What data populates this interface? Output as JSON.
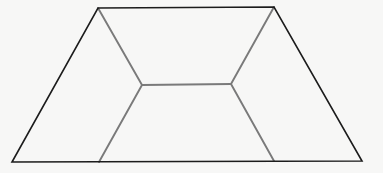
{
  "figure": {
    "type": "trapezoid-dissection",
    "background": "#f7f7f6",
    "outer_stroke": "#1c1c1c",
    "inner_stroke": "#7a7a7a",
    "outer_width": 1.6,
    "inner_width": 1.9,
    "outer_trapezoid": [
      [
        98,
        8
      ],
      [
        274,
        7
      ],
      [
        362,
        161
      ],
      [
        12,
        162
      ]
    ],
    "inner_segments": [
      {
        "name": "upper-left-diagonal",
        "from": [
          98,
          8
        ],
        "to": [
          142,
          85
        ]
      },
      {
        "name": "upper-right-diagonal",
        "from": [
          274,
          7
        ],
        "to": [
          231,
          84
        ]
      },
      {
        "name": "middle-horizontal",
        "from": [
          142,
          85
        ],
        "to": [
          231,
          84
        ]
      },
      {
        "name": "lower-left-diagonal",
        "from": [
          142,
          85
        ],
        "to": [
          99,
          162
        ]
      },
      {
        "name": "lower-right-diagonal",
        "from": [
          231,
          84
        ],
        "to": [
          274,
          161
        ]
      }
    ]
  }
}
